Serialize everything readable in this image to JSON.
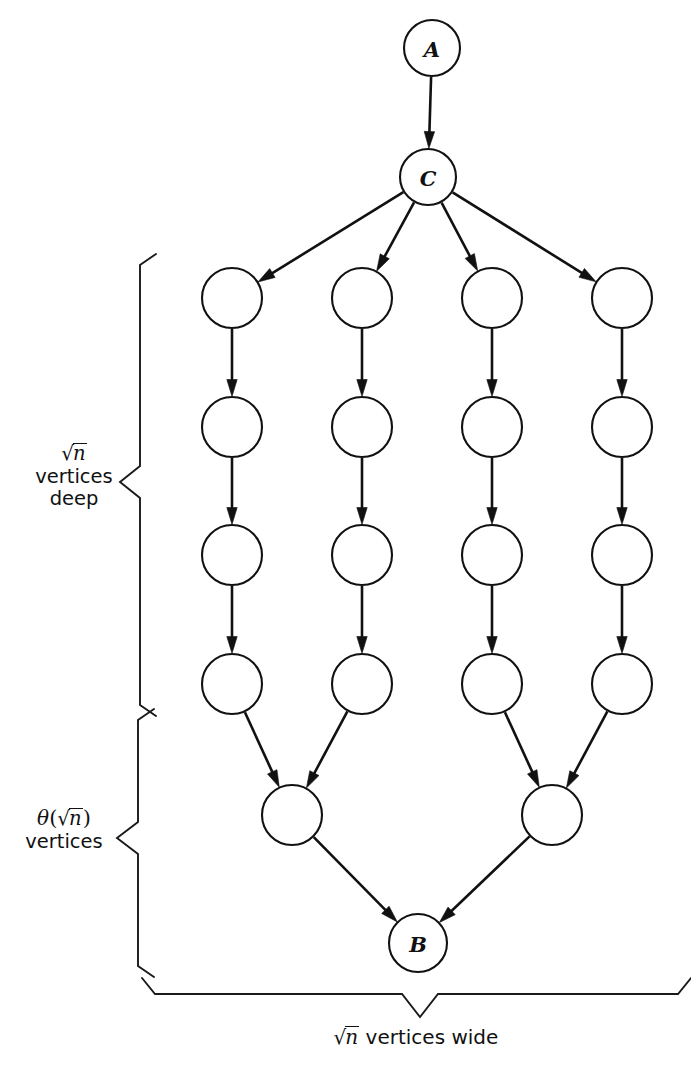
{
  "diagram": {
    "background_color": "#ffffff",
    "stroke_color": "#111111",
    "node_fill": "#ffffff",
    "nodes": [
      {
        "id": "A",
        "label": "A",
        "cx": 432,
        "cy": 48,
        "r": 28
      },
      {
        "id": "C",
        "label": "C",
        "cx": 428,
        "cy": 177,
        "r": 28
      },
      {
        "id": "n11",
        "label": "",
        "cx": 232,
        "cy": 298,
        "r": 30
      },
      {
        "id": "n21",
        "label": "",
        "cx": 362,
        "cy": 298,
        "r": 30
      },
      {
        "id": "n31",
        "label": "",
        "cx": 492,
        "cy": 298,
        "r": 30
      },
      {
        "id": "n41",
        "label": "",
        "cx": 622,
        "cy": 298,
        "r": 30
      },
      {
        "id": "n12",
        "label": "",
        "cx": 232,
        "cy": 427,
        "r": 30
      },
      {
        "id": "n22",
        "label": "",
        "cx": 362,
        "cy": 427,
        "r": 30
      },
      {
        "id": "n32",
        "label": "",
        "cx": 492,
        "cy": 427,
        "r": 30
      },
      {
        "id": "n42",
        "label": "",
        "cx": 622,
        "cy": 427,
        "r": 30
      },
      {
        "id": "n13",
        "label": "",
        "cx": 232,
        "cy": 555,
        "r": 30
      },
      {
        "id": "n23",
        "label": "",
        "cx": 362,
        "cy": 555,
        "r": 30
      },
      {
        "id": "n33",
        "label": "",
        "cx": 492,
        "cy": 555,
        "r": 30
      },
      {
        "id": "n43",
        "label": "",
        "cx": 622,
        "cy": 555,
        "r": 30
      },
      {
        "id": "n14",
        "label": "",
        "cx": 232,
        "cy": 684,
        "r": 30
      },
      {
        "id": "n24",
        "label": "",
        "cx": 362,
        "cy": 684,
        "r": 30
      },
      {
        "id": "n34",
        "label": "",
        "cx": 492,
        "cy": 684,
        "r": 30
      },
      {
        "id": "n44",
        "label": "",
        "cx": 622,
        "cy": 684,
        "r": 30
      },
      {
        "id": "m1",
        "label": "",
        "cx": 292,
        "cy": 815,
        "r": 30
      },
      {
        "id": "m2",
        "label": "",
        "cx": 552,
        "cy": 815,
        "r": 30
      },
      {
        "id": "B",
        "label": "B",
        "cx": 418,
        "cy": 943,
        "r": 29
      }
    ],
    "edges": [
      {
        "from": "A",
        "to": "C"
      },
      {
        "from": "C",
        "to": "n11"
      },
      {
        "from": "C",
        "to": "n21"
      },
      {
        "from": "C",
        "to": "n31"
      },
      {
        "from": "C",
        "to": "n41"
      },
      {
        "from": "n11",
        "to": "n12"
      },
      {
        "from": "n21",
        "to": "n22"
      },
      {
        "from": "n31",
        "to": "n32"
      },
      {
        "from": "n41",
        "to": "n42"
      },
      {
        "from": "n12",
        "to": "n13"
      },
      {
        "from": "n22",
        "to": "n23"
      },
      {
        "from": "n32",
        "to": "n33"
      },
      {
        "from": "n42",
        "to": "n43"
      },
      {
        "from": "n13",
        "to": "n14"
      },
      {
        "from": "n23",
        "to": "n24"
      },
      {
        "from": "n33",
        "to": "n34"
      },
      {
        "from": "n43",
        "to": "n44"
      },
      {
        "from": "n14",
        "to": "m1"
      },
      {
        "from": "n24",
        "to": "m1"
      },
      {
        "from": "n34",
        "to": "m2"
      },
      {
        "from": "n44",
        "to": "m2"
      },
      {
        "from": "m1",
        "to": "B"
      },
      {
        "from": "m2",
        "to": "B"
      }
    ],
    "braces": [
      {
        "id": "brace-depth",
        "orientation": "vertical-left",
        "x": 140,
        "y_top": 265,
        "y_bottom": 705,
        "tip_x": 120,
        "tip_y": 482
      },
      {
        "id": "brace-merge",
        "orientation": "vertical-left",
        "x": 138,
        "y_top": 720,
        "y_bottom": 966,
        "tip_x": 117,
        "tip_y": 838
      },
      {
        "id": "brace-width",
        "orientation": "horizontal-bottom",
        "x_left": 155,
        "x_right": 678,
        "y": 994,
        "tip_x": 420,
        "tip_y": 1017
      }
    ]
  },
  "labels": {
    "depth": {
      "line1_radical_sign": "√",
      "line1_radicand": "n",
      "line2": "vertices",
      "line3": "deep",
      "plain": "√n vertices deep"
    },
    "merge": {
      "theta": "θ",
      "open_paren": "(",
      "radical_sign": "√",
      "radicand": "n",
      "close_paren": ")",
      "line2": "vertices",
      "plain": "θ(√n ) vertices"
    },
    "width": {
      "radical_sign": "√",
      "radicand": "n",
      "rest": "vertices wide",
      "plain": "√n vertices wide"
    }
  }
}
